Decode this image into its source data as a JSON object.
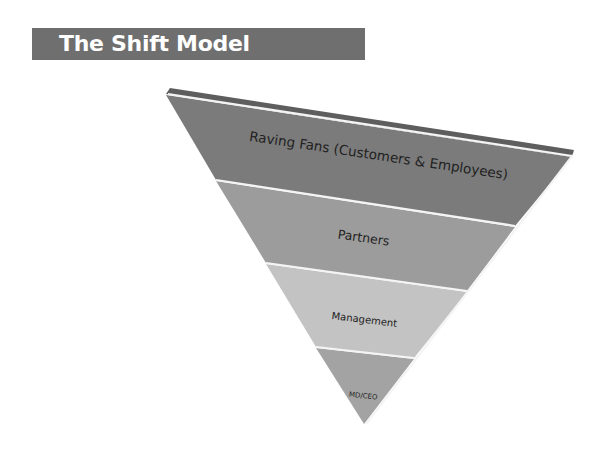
{
  "title": "The Shift Model",
  "colors": {
    "title_bar": "#6f6f6f",
    "title_text": "#ffffff",
    "bevel": "#5e5e5e",
    "separator": "#f4f4f4"
  },
  "pyramid": {
    "orientation": "inverted",
    "levels": [
      {
        "label": "Raving Fans (Customers & Employees)",
        "color": "#7b7b7b"
      },
      {
        "label": "Partners",
        "color": "#9c9c9c"
      },
      {
        "label": "Management",
        "color": "#c3c3c3"
      },
      {
        "label": "MD/CEO",
        "color": "#a3a3a3"
      }
    ]
  }
}
